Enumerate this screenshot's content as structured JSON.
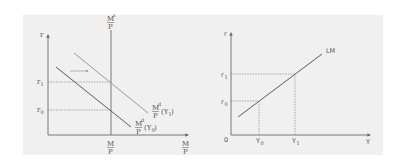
{
  "figure": {
    "background_color": "#f0f0f0",
    "axis_color": "#6a6a6a",
    "curve_dark_color": "#5a5a5a",
    "curve_light_color": "#9a9a9a",
    "dashed_color": "#777777"
  },
  "money_market": {
    "y_axis_label": "r",
    "x_axis_label_num": "M",
    "x_axis_label_den": "P",
    "supply": {
      "label_num": "M",
      "label_sup": "s",
      "label_den": "P",
      "bottom_label_num": "M",
      "bottom_label_den": "P"
    },
    "demand_y0": {
      "label_num": "M",
      "label_sup": "d",
      "label_den": "P",
      "label_arg": "(Y",
      "label_sub": "0",
      "label_close": ")"
    },
    "demand_y1": {
      "label_num": "M",
      "label_sup": "d",
      "label_den": "P",
      "label_arg": "(Y",
      "label_sub": "1",
      "label_close": ")"
    },
    "shift_arrow": "rightward-shift",
    "r1_label": "r",
    "r1_sub": "1",
    "r0_label": "r",
    "r0_sub": "0"
  },
  "lm_curve": {
    "y_axis_label": "r",
    "x_axis_label": "Y",
    "origin_label": "0",
    "curve_label": "LM",
    "r1_label": "r",
    "r1_sub": "1",
    "r0_label": "r",
    "r0_sub": "0",
    "y0_label": "Y",
    "y0_sub": "0",
    "y1_label": "Y",
    "y1_sub": "1"
  }
}
